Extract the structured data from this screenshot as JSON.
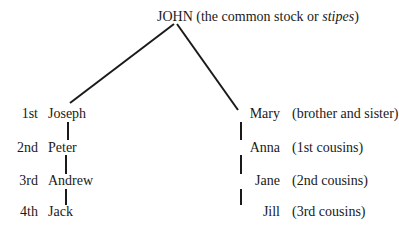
{
  "root": {
    "name": "JOHN",
    "note_prefix": "(the common stock or ",
    "note_italic": "stipes",
    "note_suffix": ")"
  },
  "rows": [
    {
      "degree": "1st",
      "left": "Joseph",
      "right": "Mary",
      "relation": "(brother and sister)"
    },
    {
      "degree": "2nd",
      "left": "Peter",
      "right": "Anna",
      "relation": "(1st cousins)"
    },
    {
      "degree": "3rd",
      "left": "Andrew",
      "right": "Jane",
      "relation": "(2nd cousins)"
    },
    {
      "degree": "4th",
      "left": "Jack",
      "right": "Jill",
      "relation": "(3rd cousins)"
    }
  ]
}
